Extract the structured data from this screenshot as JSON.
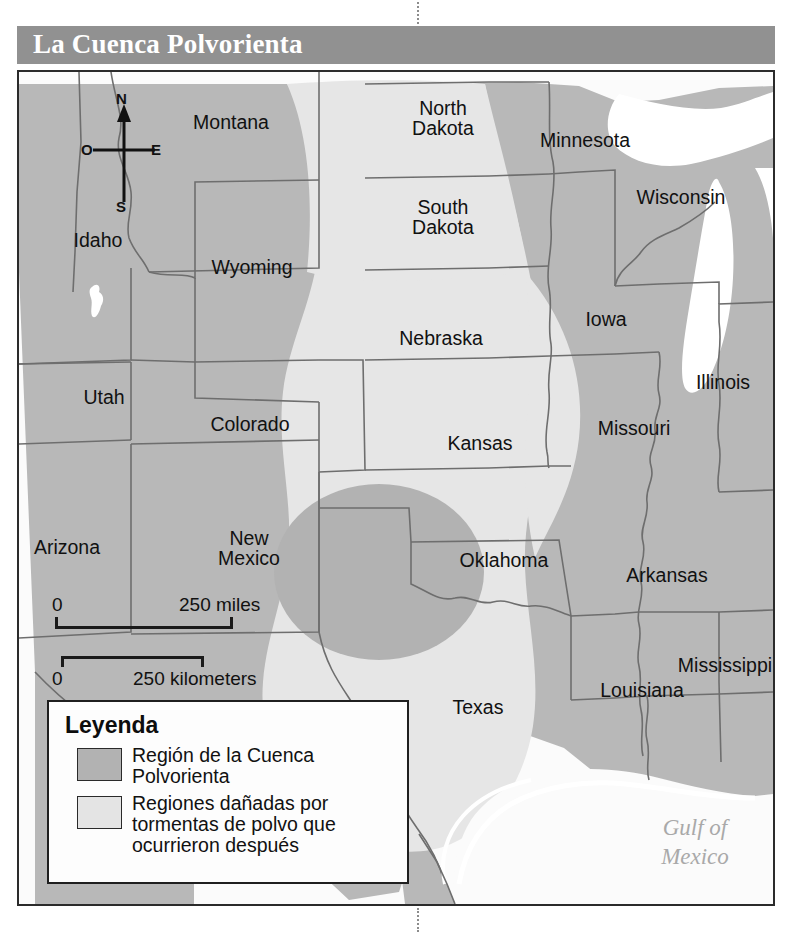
{
  "title": "La Cuenca Polvorienta",
  "colors": {
    "title_bar_bg": "#919191",
    "title_text": "#ffffff",
    "land": "#b8b8b8",
    "water": "#ffffff",
    "later_damage_region": "#e6e6e6",
    "dust_bowl_core": "#b2b2b2",
    "border_line": "#6e6e6e",
    "frame": "#2b2b2b",
    "gulf_label": "#a9a9a9"
  },
  "compass": {
    "north": "N",
    "south": "S",
    "east": "E",
    "west": "O"
  },
  "scale": {
    "miles_zero": "0",
    "miles_label": "250 miles",
    "kilometers_zero": "0",
    "kilometers_label": "250 kilometers"
  },
  "legend": {
    "title": "Leyenda",
    "items": [
      {
        "swatch": "core",
        "label": "Región de la Cuenca\nPolvorienta"
      },
      {
        "swatch": "later",
        "label": "Regiones dañadas por\ntormentas de polvo que\nocurrieron después"
      }
    ]
  },
  "map": {
    "water_labels": [
      {
        "name": "gulf-of-mexico",
        "text": "Gulf of\nMexico"
      }
    ],
    "states": [
      {
        "name": "montana",
        "text": "Montana",
        "x": 212,
        "y": 40
      },
      {
        "name": "north-dakota",
        "text": "North\nDakota",
        "x": 424,
        "y": 33
      },
      {
        "name": "minnesota",
        "text": "Minnesota",
        "x": 566,
        "y": 68
      },
      {
        "name": "wisconsin",
        "text": "Wisconsin",
        "x": 662,
        "y": 124
      },
      {
        "name": "idaho",
        "text": "Idaho",
        "x": 79,
        "y": 168
      },
      {
        "name": "south-dakota",
        "text": "South\nDakota",
        "x": 424,
        "y": 131
      },
      {
        "name": "wyoming",
        "text": "Wyoming",
        "x": 233,
        "y": 195
      },
      {
        "name": "iowa",
        "text": "Iowa",
        "x": 587,
        "y": 247
      },
      {
        "name": "nebraska",
        "text": "Nebraska",
        "x": 422,
        "y": 265
      },
      {
        "name": "illinois",
        "text": "Illinois",
        "x": 704,
        "y": 310
      },
      {
        "name": "utah",
        "text": "Utah",
        "x": 85,
        "y": 325
      },
      {
        "name": "colorado",
        "text": "Colorado",
        "x": 231,
        "y": 352
      },
      {
        "name": "kansas",
        "text": "Kansas",
        "x": 461,
        "y": 371
      },
      {
        "name": "missouri",
        "text": "Missouri",
        "x": 615,
        "y": 356
      },
      {
        "name": "arizona",
        "text": "Arizona",
        "x": 48,
        "y": 475
      },
      {
        "name": "new-mexico",
        "text": "New\nMexico",
        "x": 230,
        "y": 466
      },
      {
        "name": "oklahoma",
        "text": "Oklahoma",
        "x": 485,
        "y": 488
      },
      {
        "name": "arkansas",
        "text": "Arkansas",
        "x": 648,
        "y": 503
      },
      {
        "name": "mississippi",
        "text": "Mississippi",
        "x": 706,
        "y": 593
      },
      {
        "name": "texas",
        "text": "Texas",
        "x": 459,
        "y": 635
      },
      {
        "name": "louisiana",
        "text": "Louisiana",
        "x": 623,
        "y": 618
      }
    ]
  }
}
